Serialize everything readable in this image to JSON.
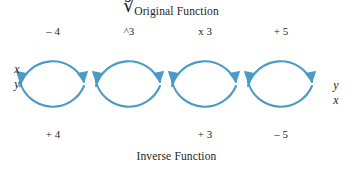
{
  "diagram": {
    "type": "function-inverse-flow",
    "accent_color": "#4A9CC6",
    "text_color": "#231f20",
    "background": "#ffffff",
    "caption_top": "Original Function",
    "caption_bottom": "Inverse Function",
    "input_variables": {
      "top": "x",
      "bottom": "y"
    },
    "output_variables": {
      "top": "y",
      "bottom": "x"
    },
    "steps": [
      {
        "forward": "– 4",
        "inverse": "+ 4"
      },
      {
        "forward": "^3",
        "inverse": "∛"
      },
      {
        "forward": "x 3",
        "inverse": "+ 3"
      },
      {
        "forward": "+ 5",
        "inverse": "– 5"
      }
    ]
  }
}
